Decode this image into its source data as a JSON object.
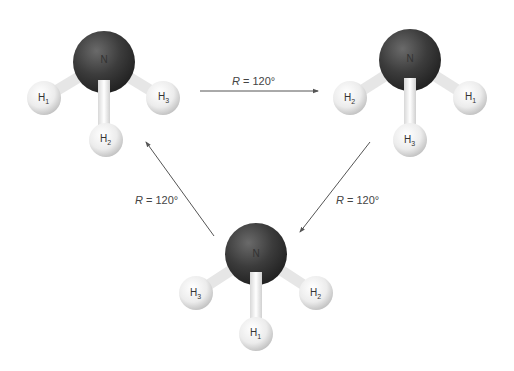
{
  "diagram": {
    "molecules": [
      {
        "id": "top-left",
        "center": "N",
        "left": "H1",
        "bottom": "H2",
        "right": "H3"
      },
      {
        "id": "top-right",
        "center": "N",
        "left": "H2",
        "bottom": "H3",
        "right": "H1"
      },
      {
        "id": "bottom",
        "center": "N",
        "left": "H3",
        "bottom": "H1",
        "right": "H2"
      }
    ],
    "arrows": [
      {
        "from": "top-left",
        "to": "top-right",
        "label_var": "R",
        "label_val": " = 120°"
      },
      {
        "from": "top-right",
        "to": "bottom",
        "label_var": "R",
        "label_val": " = 120°"
      },
      {
        "from": "bottom",
        "to": "top-left",
        "label_var": "R",
        "label_val": " = 120°"
      }
    ],
    "colors": {
      "nitrogen": "#3a3a3a",
      "hydrogen": "#eeeeee",
      "bond": "#f2f2f2",
      "arrow": "#555555"
    }
  },
  "m1": {
    "n": "N",
    "h_left": "H",
    "h_left_sub": "1",
    "h_bottom": "H",
    "h_bottom_sub": "2",
    "h_right": "H",
    "h_right_sub": "3"
  },
  "m2": {
    "n": "N",
    "h_left": "H",
    "h_left_sub": "2",
    "h_bottom": "H",
    "h_bottom_sub": "3",
    "h_right": "H",
    "h_right_sub": "1"
  },
  "m3": {
    "n": "N",
    "h_left": "H",
    "h_left_sub": "3",
    "h_bottom": "H",
    "h_bottom_sub": "1",
    "h_right": "H",
    "h_right_sub": "2"
  },
  "labels": {
    "top": {
      "var": "R",
      "rest": " = 120°"
    },
    "right": {
      "var": "R",
      "rest": " = 120°"
    },
    "left": {
      "var": "R",
      "rest": " = 120°"
    }
  }
}
